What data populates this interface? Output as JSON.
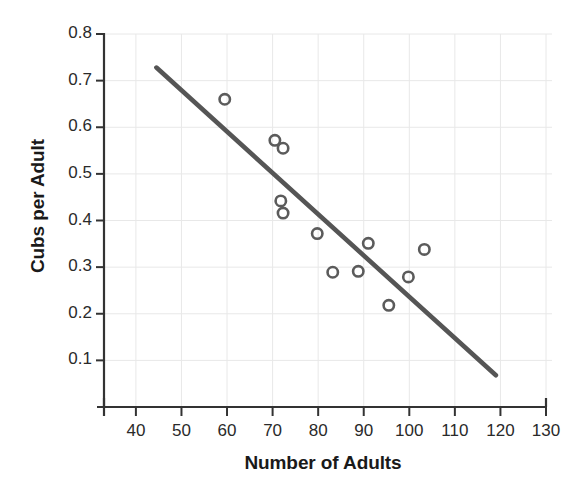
{
  "chart_data": {
    "type": "scatter",
    "title": "",
    "xlabel": "Number of Adults",
    "ylabel": "Cubs per Adult",
    "xlim": [
      33,
      130
    ],
    "ylim": [
      0.0,
      0.8
    ],
    "grid": true,
    "legend": null,
    "xticks": [
      40,
      50,
      60,
      70,
      80,
      90,
      100,
      110,
      120,
      130
    ],
    "xtick_labels": [
      "40",
      "50",
      "60",
      "70",
      "80",
      "90",
      "100",
      "110",
      "120",
      "130"
    ],
    "yticks": [
      0.1,
      0.2,
      0.3,
      0.4,
      0.5,
      0.6,
      0.7,
      0.8
    ],
    "ytick_labels": [
      "0.1",
      "0.2",
      "0.3",
      "0.4",
      "0.5",
      "0.6",
      "0.7",
      "0.8"
    ],
    "marker": "open-circle",
    "marker_color": "#5b5b5b",
    "points": [
      {
        "x": 59.5,
        "y": 0.66
      },
      {
        "x": 70.5,
        "y": 0.572
      },
      {
        "x": 72.3,
        "y": 0.555
      },
      {
        "x": 71.8,
        "y": 0.442
      },
      {
        "x": 72.3,
        "y": 0.416
      },
      {
        "x": 79.8,
        "y": 0.372
      },
      {
        "x": 83.2,
        "y": 0.289
      },
      {
        "x": 88.8,
        "y": 0.291
      },
      {
        "x": 91.0,
        "y": 0.351
      },
      {
        "x": 95.5,
        "y": 0.218
      },
      {
        "x": 99.8,
        "y": 0.279
      },
      {
        "x": 103.3,
        "y": 0.338
      }
    ],
    "trendline": {
      "name": "least-squares fit",
      "color": "#555555",
      "x_start": 44.5,
      "y_start": 0.728,
      "x_end": 119.0,
      "y_end": 0.068
    }
  },
  "axes": {
    "y_title": "Cubs per Adult",
    "x_title": "Number of Adults"
  }
}
